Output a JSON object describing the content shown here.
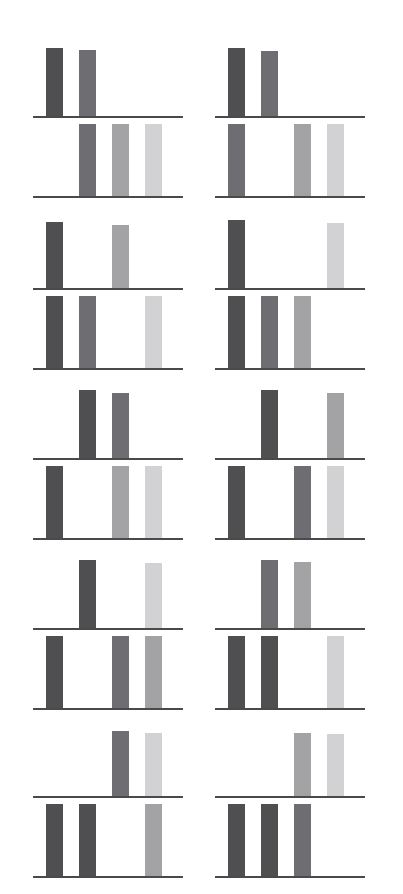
{
  "figure": {
    "title": "",
    "background_color": "#ffffff",
    "axis_color": "#4a4a4a",
    "width": 403,
    "height": 894,
    "columns": 2,
    "rows": 5,
    "subplots_per_panel": 2,
    "category_slots": 4
  },
  "palette": {
    "shade_1": "#4f4f52",
    "shade_2": "#6e6e72",
    "shade_3": "#a3a3a6",
    "shade_4": "#d2d2d4"
  },
  "chart_data": {
    "type": "bar",
    "title": "",
    "subtitle": "",
    "xlabel": "",
    "ylabel": "",
    "grid": false,
    "legend": "none",
    "categories": [
      "1",
      "2",
      "3",
      "4"
    ],
    "ylim": [
      0,
      1
    ],
    "series_colors": [
      "#4f4f52",
      "#6e6e72",
      "#a3a3a6",
      "#d2d2d4"
    ],
    "panels": [
      {
        "panel_id": "panel-r1c1",
        "row": 1,
        "column": 1,
        "upper": {
          "values": [
            0.95,
            0.92,
            0,
            0
          ],
          "colors": [
            "#4f4f52",
            "#6e6e72",
            null,
            null
          ]
        },
        "lower": {
          "values": [
            0,
            1.0,
            1.0,
            1.0
          ],
          "colors": [
            null,
            "#6e6e72",
            "#a3a3a6",
            "#d2d2d4"
          ]
        }
      },
      {
        "panel_id": "panel-r1c2",
        "row": 1,
        "column": 2,
        "upper": {
          "values": [
            0.95,
            0.9,
            0,
            0
          ],
          "colors": [
            "#4f4f52",
            "#6e6e72",
            null,
            null
          ]
        },
        "lower": {
          "values": [
            1.0,
            0,
            1.0,
            1.0
          ],
          "colors": [
            "#6e6e72",
            null,
            "#a3a3a6",
            "#d2d2d4"
          ]
        }
      },
      {
        "panel_id": "panel-r2c1",
        "row": 2,
        "column": 1,
        "upper": {
          "values": [
            0.92,
            0,
            0.88,
            0
          ],
          "colors": [
            "#4f4f52",
            null,
            "#a3a3a6",
            null
          ]
        },
        "lower": {
          "values": [
            1.0,
            1.0,
            0,
            1.0
          ],
          "colors": [
            "#4f4f52",
            "#6e6e72",
            null,
            "#d2d2d4"
          ]
        }
      },
      {
        "panel_id": "panel-r2c2",
        "row": 2,
        "column": 2,
        "upper": {
          "values": [
            0.95,
            0,
            0,
            0.9
          ],
          "colors": [
            "#4f4f52",
            null,
            null,
            "#d2d2d4"
          ]
        },
        "lower": {
          "values": [
            1.0,
            1.0,
            1.0,
            0
          ],
          "colors": [
            "#4f4f52",
            "#6e6e72",
            "#a3a3a6",
            null
          ]
        }
      },
      {
        "panel_id": "panel-r3c1",
        "row": 3,
        "column": 1,
        "upper": {
          "values": [
            0,
            0.95,
            0.9,
            0
          ],
          "colors": [
            null,
            "#4f4f52",
            "#6e6e72",
            null
          ]
        },
        "lower": {
          "values": [
            1.0,
            0,
            1.0,
            1.0
          ],
          "colors": [
            "#4f4f52",
            null,
            "#a3a3a6",
            "#d2d2d4"
          ]
        }
      },
      {
        "panel_id": "panel-r3c2",
        "row": 3,
        "column": 2,
        "upper": {
          "values": [
            0,
            0.95,
            0,
            0.9
          ],
          "colors": [
            null,
            "#4f4f52",
            null,
            "#a3a3a6"
          ]
        },
        "lower": {
          "values": [
            1.0,
            0,
            1.0,
            1.0
          ],
          "colors": [
            "#4f4f52",
            null,
            "#6e6e72",
            "#d2d2d4"
          ]
        }
      },
      {
        "panel_id": "panel-r4c1",
        "row": 4,
        "column": 1,
        "upper": {
          "values": [
            0,
            0.95,
            0,
            0.9
          ],
          "colors": [
            null,
            "#4f4f52",
            null,
            "#d2d2d4"
          ]
        },
        "lower": {
          "values": [
            1.0,
            0,
            1.0,
            1.0
          ],
          "colors": [
            "#4f4f52",
            null,
            "#6e6e72",
            "#a3a3a6"
          ]
        }
      },
      {
        "panel_id": "panel-r4c2",
        "row": 4,
        "column": 2,
        "upper": {
          "values": [
            0,
            0.95,
            0.92,
            0
          ],
          "colors": [
            null,
            "#6e6e72",
            "#a3a3a6",
            null
          ]
        },
        "lower": {
          "values": [
            1.0,
            1.0,
            0,
            1.0
          ],
          "colors": [
            "#4f4f52",
            "#4f4f52",
            null,
            "#d2d2d4"
          ]
        }
      },
      {
        "panel_id": "panel-r5c1",
        "row": 5,
        "column": 1,
        "upper": {
          "values": [
            0,
            0,
            0.9,
            0.88
          ],
          "colors": [
            null,
            null,
            "#6e6e72",
            "#d2d2d4"
          ]
        },
        "lower": {
          "values": [
            1.0,
            1.0,
            0,
            1.0
          ],
          "colors": [
            "#4f4f52",
            "#4f4f52",
            null,
            "#a3a3a6"
          ]
        }
      },
      {
        "panel_id": "panel-r5c2",
        "row": 5,
        "column": 2,
        "upper": {
          "values": [
            0,
            0,
            0.88,
            0.86
          ],
          "colors": [
            null,
            null,
            "#a3a3a6",
            "#d2d2d4"
          ]
        },
        "lower": {
          "values": [
            1.0,
            1.0,
            1.0,
            0
          ],
          "colors": [
            "#4f4f52",
            "#4f4f52",
            "#6e6e72",
            null
          ]
        }
      }
    ]
  },
  "layout": {
    "column_x": [
      33,
      215
    ],
    "panel_width": 150,
    "row_top_y": [
      44,
      216,
      386,
      556,
      724
    ],
    "upper_plot_height": 72,
    "lower_plot_height": 72,
    "subplot_gap": 8,
    "bar_width": 17,
    "slot_pitch": 33,
    "slot_offset": 13
  }
}
